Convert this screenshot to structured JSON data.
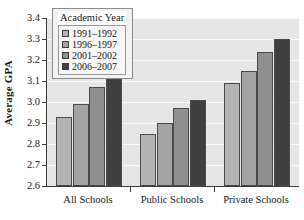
{
  "chart_data": {
    "type": "bar",
    "title": "",
    "xlabel": "",
    "ylabel": "Average GPA",
    "ylim": [
      2.6,
      3.4
    ],
    "ytick_step": 0.1,
    "grid": true,
    "legend_position": "top-left",
    "legend_title": "Academic Year",
    "categories": [
      "All Schools",
      "Public Schools",
      "Private Schools"
    ],
    "yticks": [
      "3.4",
      "3.3",
      "3.2",
      "3.1",
      "3.0",
      "2.9",
      "2.8",
      "2.7",
      "2.6"
    ],
    "series": [
      {
        "name": "1991–1992",
        "color": "#b4b4b4",
        "values": [
          2.93,
          2.85,
          3.09
        ]
      },
      {
        "name": "1996–1997",
        "color": "#a3a3a3",
        "values": [
          2.99,
          2.9,
          3.15
        ]
      },
      {
        "name": "2001–2002",
        "color": "#8f8f8f",
        "values": [
          3.07,
          2.97,
          3.24
        ]
      },
      {
        "name": "2006–2007",
        "color": "#3f3f3f",
        "values": [
          3.11,
          3.01,
          3.3
        ]
      }
    ]
  },
  "style": {
    "plot_background": "#e6e6e6",
    "gridline_color": "#fafafa",
    "axis_color": "#3b3b3b",
    "bar_border": "#4a4a4a",
    "page_background": "#ffffff"
  }
}
